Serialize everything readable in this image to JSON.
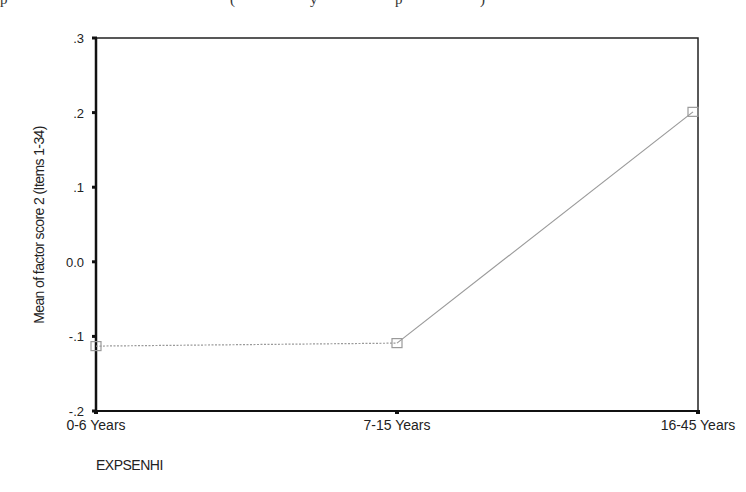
{
  "header_fragment": "(cut-off caption text above chart)",
  "chart_data": {
    "type": "line",
    "title": "",
    "xlabel": "EXPSENHI",
    "ylabel": "Mean of factor score 2 (Items 1-34)",
    "categories": [
      "0-6 Years",
      "7-15 Years",
      "16-45 Years"
    ],
    "series": [
      {
        "name": "Mean of factor score 2 (Items 1-34)",
        "values": [
          -0.113,
          -0.109,
          0.201
        ],
        "marker": "square",
        "color": "#9a9a9a"
      }
    ],
    "yticks": [
      ".3",
      ".2",
      ".1",
      "0.0",
      "-.1",
      "-.2"
    ],
    "ytick_values": [
      0.3,
      0.2,
      0.1,
      0.0,
      -0.1,
      -0.2
    ],
    "ylim": [
      -0.2,
      0.3
    ],
    "grid": false,
    "legend": "none",
    "frame": "box"
  }
}
